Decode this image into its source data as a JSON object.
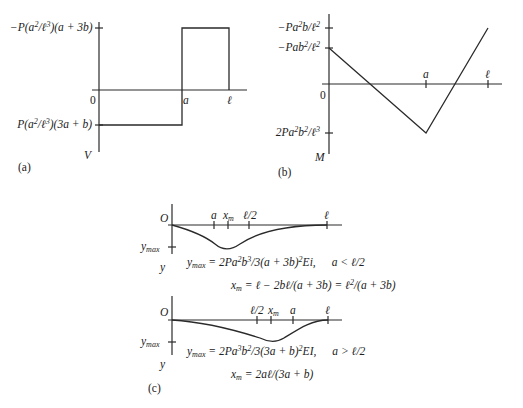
{
  "panel_a": {
    "caption": "(a)",
    "axis_y_label": "V",
    "origin": "0",
    "x_ticks": {
      "a": "a",
      "l": "ℓ"
    },
    "top_value": {
      "pre": "−P(a",
      "exp1": "2",
      "mid": "/ℓ",
      "exp2": "3",
      "post": ")(a + 3b)"
    },
    "bottom_value": {
      "pre": "P(a",
      "exp1": "2",
      "mid": "/ℓ",
      "exp2": "3",
      "post": ")(3a + b)"
    }
  },
  "panel_b": {
    "caption": "(b)",
    "axis_y_label": "M",
    "origin": "0",
    "x_ticks": {
      "a": "a",
      "l": "ℓ"
    },
    "top_value": {
      "pre": "−Pa",
      "exp1": "2",
      "mid": "b/ℓ",
      "exp2": "2"
    },
    "second_value": {
      "pre": "−Pab",
      "exp1": "2",
      "mid": "/ℓ",
      "exp2": "2"
    },
    "bottom_value": {
      "pre": "2Pa",
      "exp1": "2",
      "mid": "b",
      "exp2": "2",
      "mid2": "/ℓ",
      "exp3": "3"
    }
  },
  "panel_c": {
    "caption": "(c)",
    "upper": {
      "origin": "O",
      "ymax_label": "y",
      "ymax_sub": "max",
      "axis_y_label": "y",
      "ticks": [
        "a",
        "x",
        "ℓ/2",
        "ℓ"
      ],
      "xm_sub": "m",
      "formula_ymax": {
        "lhs": "y",
        "lhs_sub": "max",
        "rhs1": " = 2Pa",
        "e1": "2",
        "rhs2": "b",
        "e2": "3",
        "rhs3": "/3(a + 3b)",
        "e3": "2",
        "rhs4": "Ei,",
        "cond": "a < ℓ/2"
      },
      "formula_xm": {
        "lhs": "x",
        "lhs_sub": "m",
        "rhs1": " = ℓ − 2bℓ/(a + 3b) = ℓ",
        "e1": "2",
        "rhs2": "/(a + 3b)"
      }
    },
    "lower": {
      "origin": "O",
      "ymax_label": "y",
      "ymax_sub": "max",
      "axis_y_label": "y",
      "ticks": [
        "ℓ/2",
        "x",
        "a",
        "ℓ"
      ],
      "xm_sub": "m",
      "formula_ymax": {
        "lhs": "y",
        "lhs_sub": "max",
        "rhs1": " = 2Pa",
        "e1": "3",
        "rhs2": "b",
        "e2": "2",
        "rhs3": "/3(3a + b)",
        "e3": "2",
        "rhs4": "EI,",
        "cond": "a > ℓ/2"
      },
      "formula_xm": {
        "lhs": "x",
        "lhs_sub": "m",
        "rhs1": " = 2aℓ/(3a + b)"
      }
    }
  },
  "colors": {
    "line": "#2a2a2a",
    "background": "#ffffff"
  }
}
